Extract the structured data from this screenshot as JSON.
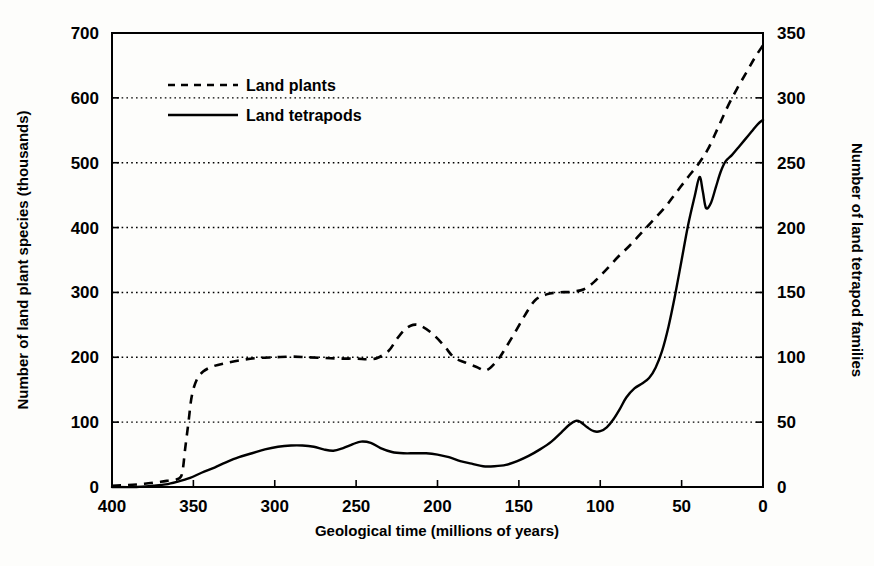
{
  "chart_data": {
    "type": "line",
    "title": "",
    "xlabel": "Geological time (millions of years)",
    "ylabel": "Number of land plant species (thousands)",
    "y2label": "Number of land tetrapod families",
    "xlim": [
      400,
      0
    ],
    "x_reversed": true,
    "ylim": [
      0,
      700
    ],
    "y2lim": [
      0,
      350
    ],
    "xticks": [
      400,
      350,
      300,
      250,
      200,
      150,
      100,
      50,
      0
    ],
    "xtick_labels": [
      "400",
      "350",
      "300",
      "250",
      "200",
      "150",
      "100",
      "50",
      "0"
    ],
    "yticks": [
      0,
      100,
      200,
      300,
      400,
      500,
      600,
      700
    ],
    "ytick_labels": [
      "0",
      "100",
      "200",
      "300",
      "400",
      "500",
      "600",
      "700"
    ],
    "y2ticks": [
      0,
      50,
      100,
      150,
      200,
      250,
      300,
      350
    ],
    "y2tick_labels": [
      "0",
      "50",
      "100",
      "150",
      "200",
      "250",
      "300",
      "350"
    ],
    "grid": true,
    "grid_style": "dotted-horizontal",
    "legend_position": "top-left-inside",
    "series": [
      {
        "name": "Land plants",
        "axis": "left",
        "style": "dashed",
        "unit": "thousands of species",
        "points": [
          [
            400,
            2
          ],
          [
            390,
            3
          ],
          [
            380,
            5
          ],
          [
            370,
            8
          ],
          [
            365,
            10
          ],
          [
            360,
            12
          ],
          [
            357,
            20
          ],
          [
            355,
            60
          ],
          [
            353,
            100
          ],
          [
            351,
            140
          ],
          [
            348,
            165
          ],
          [
            344,
            178
          ],
          [
            338,
            186
          ],
          [
            330,
            191
          ],
          [
            320,
            196
          ],
          [
            310,
            199
          ],
          [
            300,
            200
          ],
          [
            290,
            201
          ],
          [
            280,
            200
          ],
          [
            270,
            199
          ],
          [
            260,
            198
          ],
          [
            250,
            198
          ],
          [
            243,
            197
          ],
          [
            237,
            199
          ],
          [
            230,
            210
          ],
          [
            225,
            228
          ],
          [
            220,
            243
          ],
          [
            215,
            250
          ],
          [
            210,
            248
          ],
          [
            203,
            236
          ],
          [
            196,
            218
          ],
          [
            190,
            200
          ],
          [
            183,
            192
          ],
          [
            176,
            185
          ],
          [
            170,
            180
          ],
          [
            163,
            196
          ],
          [
            158,
            215
          ],
          [
            152,
            240
          ],
          [
            146,
            266
          ],
          [
            140,
            288
          ],
          [
            133,
            297
          ],
          [
            126,
            300
          ],
          [
            118,
            301
          ],
          [
            110,
            305
          ],
          [
            103,
            318
          ],
          [
            96,
            336
          ],
          [
            89,
            355
          ],
          [
            82,
            372
          ],
          [
            75,
            391
          ],
          [
            68,
            410
          ],
          [
            60,
            432
          ],
          [
            53,
            455
          ],
          [
            46,
            478
          ],
          [
            40,
            497
          ],
          [
            34,
            520
          ],
          [
            28,
            552
          ],
          [
            22,
            585
          ],
          [
            16,
            614
          ],
          [
            10,
            640
          ],
          [
            5,
            662
          ],
          [
            0,
            681
          ]
        ]
      },
      {
        "name": "Land tetrapods",
        "axis": "right",
        "style": "solid",
        "unit": "families",
        "points": [
          [
            400,
            0
          ],
          [
            385,
            0
          ],
          [
            375,
            1
          ],
          [
            367,
            2
          ],
          [
            360,
            4
          ],
          [
            352,
            7
          ],
          [
            345,
            11
          ],
          [
            337,
            15
          ],
          [
            330,
            19
          ],
          [
            322,
            23
          ],
          [
            314,
            26
          ],
          [
            306,
            29
          ],
          [
            298,
            31
          ],
          [
            290,
            32
          ],
          [
            283,
            32
          ],
          [
            276,
            31
          ],
          [
            270,
            29
          ],
          [
            264,
            28
          ],
          [
            258,
            30
          ],
          [
            252,
            33
          ],
          [
            247,
            35
          ],
          [
            241,
            34
          ],
          [
            235,
            30
          ],
          [
            228,
            27
          ],
          [
            221,
            26
          ],
          [
            214,
            26
          ],
          [
            207,
            26
          ],
          [
            200,
            25
          ],
          [
            193,
            23
          ],
          [
            186,
            20
          ],
          [
            179,
            18
          ],
          [
            172,
            16
          ],
          [
            165,
            16
          ],
          [
            158,
            17
          ],
          [
            151,
            20
          ],
          [
            144,
            24
          ],
          [
            137,
            29
          ],
          [
            130,
            35
          ],
          [
            124,
            42
          ],
          [
            119,
            48
          ],
          [
            115,
            51
          ],
          [
            112,
            50
          ],
          [
            108,
            46
          ],
          [
            104,
            43
          ],
          [
            100,
            43
          ],
          [
            96,
            46
          ],
          [
            92,
            52
          ],
          [
            88,
            60
          ],
          [
            84,
            69
          ],
          [
            79,
            76
          ],
          [
            74,
            80
          ],
          [
            70,
            84
          ],
          [
            66,
            92
          ],
          [
            62,
            105
          ],
          [
            58,
            124
          ],
          [
            54,
            148
          ],
          [
            50,
            175
          ],
          [
            46,
            202
          ],
          [
            42,
            224
          ],
          [
            39,
            239
          ],
          [
            37,
            228
          ],
          [
            35,
            215
          ],
          [
            32,
            219
          ],
          [
            29,
            231
          ],
          [
            26,
            243
          ],
          [
            23,
            251
          ],
          [
            19,
            256
          ],
          [
            15,
            262
          ],
          [
            11,
            268
          ],
          [
            7,
            274
          ],
          [
            3,
            280
          ],
          [
            0,
            283
          ]
        ]
      }
    ],
    "annotations": []
  },
  "legend": {
    "items": [
      {
        "label": "Land plants",
        "style": "dashed"
      },
      {
        "label": "Land tetrapods",
        "style": "solid"
      }
    ]
  }
}
